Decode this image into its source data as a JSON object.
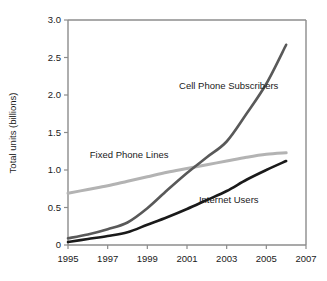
{
  "chart_data": {
    "type": "line",
    "title": "",
    "xlabel": "",
    "ylabel": "Total units (billions)",
    "xlim": [
      1995,
      2007
    ],
    "ylim": [
      0,
      3.0
    ],
    "grid": false,
    "legend_position": "inline-labels",
    "x_tick_labels": [
      "1995",
      "1997",
      "1999",
      "2001",
      "2003",
      "2005",
      "2007"
    ],
    "x_ticks": [
      1995,
      1997,
      1999,
      2001,
      2003,
      2005,
      2007
    ],
    "y_tick_labels": [
      "0",
      "0.5",
      "1.0",
      "1.5",
      "2.0",
      "2.5",
      "3.0"
    ],
    "y_ticks": [
      0,
      0.5,
      1.0,
      1.5,
      2.0,
      2.5,
      3.0
    ],
    "x": [
      1995,
      1996,
      1997,
      1998,
      1999,
      2000,
      2001,
      2002,
      2003,
      2004,
      2005,
      2006
    ],
    "series": [
      {
        "name": "Cell Phone Subscribers",
        "color": "#595959",
        "width": 2.6,
        "values": [
          0.09,
          0.14,
          0.21,
          0.3,
          0.49,
          0.73,
          0.96,
          1.17,
          1.38,
          1.75,
          2.15,
          2.67
        ],
        "label_x": 2000.6,
        "label_y": 2.08,
        "label_anchor": "start"
      },
      {
        "name": "Fixed Phone Lines",
        "color": "#b3b3b3",
        "width": 3.0,
        "values": [
          0.69,
          0.74,
          0.79,
          0.85,
          0.91,
          0.97,
          1.02,
          1.07,
          1.12,
          1.17,
          1.21,
          1.23
        ],
        "label_x": 1996.1,
        "label_y": 1.16,
        "label_anchor": "start"
      },
      {
        "name": "Internet Users",
        "color": "#1a1a1a",
        "width": 2.6,
        "values": [
          0.04,
          0.08,
          0.12,
          0.17,
          0.27,
          0.37,
          0.48,
          0.6,
          0.72,
          0.87,
          1.0,
          1.12
        ],
        "label_x": 2001.6,
        "label_y": 0.56,
        "label_anchor": "start"
      }
    ]
  },
  "axes": {
    "y_axis_title": "Total units (billions)"
  }
}
